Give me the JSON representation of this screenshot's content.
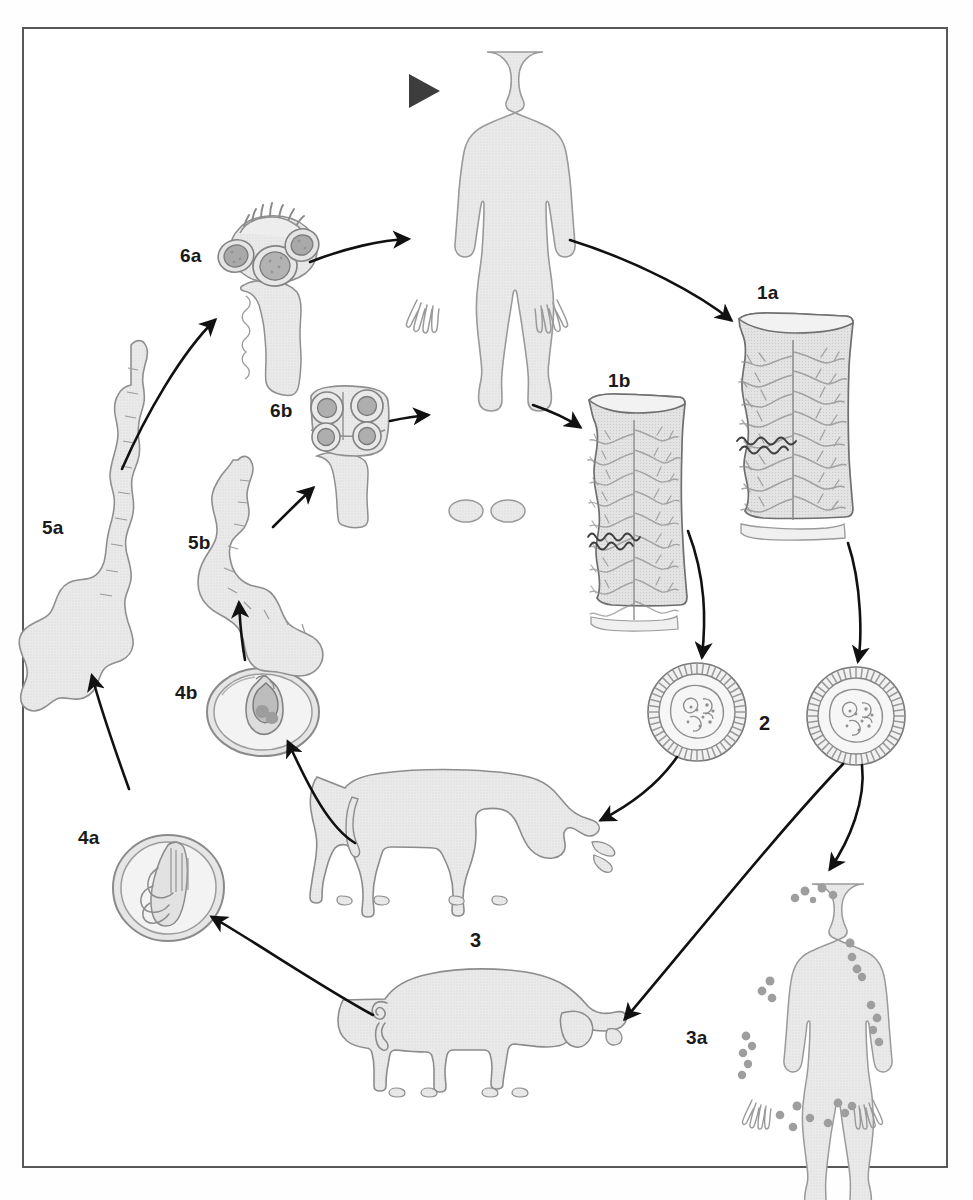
{
  "figure": {
    "kind": "parasite-life-cycle-diagram",
    "border_color": "#58585a",
    "background_color": "#ffffff",
    "body_fill": "#e8e8e8",
    "body_stroke": "#8c8c8c",
    "organ_fill": "#dedede",
    "organ_stroke": "#7d7d7d",
    "cyst_dot_color": "#9a9a9a",
    "arrow_color": "#111111",
    "label_color": "#1a1a1a",
    "marker_color": "#3a3a3a"
  },
  "labels": [
    {
      "id": "1a",
      "text": "1a",
      "x": 757,
      "y": 283,
      "desc": "gravid-proglottid-taenia-solium"
    },
    {
      "id": "1b",
      "text": "1b",
      "x": 608,
      "y": 371,
      "desc": "gravid-proglottid-taenia-saginata"
    },
    {
      "id": "2",
      "text": "2",
      "x": 759,
      "y": 713,
      "desc": "taeniid-egg"
    },
    {
      "id": "3",
      "text": "3",
      "x": 470,
      "y": 930,
      "desc": "intermediate-hosts-cattle-swine"
    },
    {
      "id": "3a",
      "text": "3a",
      "x": 686,
      "y": 1028,
      "desc": "human-cysticercosis"
    },
    {
      "id": "4a",
      "text": "4a",
      "x": 78,
      "y": 828,
      "desc": "cysticercus-cellulosae"
    },
    {
      "id": "4b",
      "text": "4b",
      "x": 175,
      "y": 683,
      "desc": "cysticercus-bovis"
    },
    {
      "id": "5a",
      "text": "5a",
      "x": 42,
      "y": 518,
      "desc": "evaginated-larva-developing-strobila-solium"
    },
    {
      "id": "5b",
      "text": "5b",
      "x": 188,
      "y": 533,
      "desc": "evaginated-larva-developing-strobila-saginata"
    },
    {
      "id": "6a",
      "text": "6a",
      "x": 180,
      "y": 246,
      "desc": "scolex-with-rostellum-and-hooks"
    },
    {
      "id": "6b",
      "text": "6b",
      "x": 270,
      "y": 401,
      "desc": "scolex-with-four-suckers"
    }
  ],
  "elements": {
    "definitive_host_human": "adult-human-silhouette-definitive-host",
    "infected_human": "human-silhouette-with-cysticerci",
    "cattle": "grazing-cow-silhouette",
    "swine": "pig-silhouette",
    "proglottid_a": "gravid-proglottid-branched-uterus",
    "proglottid_b": "gravid-proglottid-branched-uterus",
    "egg_left": "taeniid-egg-striated-embryophore",
    "egg_right": "taeniid-egg-striated-embryophore",
    "cysticercus_a": "cysticercus-larval-cyst",
    "cysticercus_b": "cysticercus-larval-cyst",
    "larva_a": "evaginated-larva-elongate",
    "larva_b": "evaginated-larva-curved",
    "scolex_a": "scolex-rostellum-hooks-suckers",
    "scolex_b": "scolex-four-suckers",
    "entry_marker": "solid-triangle-entry-marker"
  },
  "arrows": [
    {
      "id": "human-to-1a",
      "from": "definitive_host_human",
      "to": "proglottid_a"
    },
    {
      "id": "human-to-1b",
      "from": "definitive_host_human",
      "to": "proglottid_b"
    },
    {
      "id": "1a-to-egg-right",
      "from": "proglottid_a",
      "to": "egg_right"
    },
    {
      "id": "1b-to-egg-left",
      "from": "proglottid_b",
      "to": "egg_left"
    },
    {
      "id": "egg-left-to-cattle",
      "from": "egg_left",
      "to": "cattle"
    },
    {
      "id": "egg-right-to-swine",
      "from": "egg_right",
      "to": "swine"
    },
    {
      "id": "egg-right-to-human",
      "from": "egg_right",
      "to": "infected_human"
    },
    {
      "id": "swine-to-4a",
      "from": "swine",
      "to": "cysticercus_a"
    },
    {
      "id": "cattle-to-4b",
      "from": "cattle",
      "to": "cysticercus_b"
    },
    {
      "id": "4a-to-5a",
      "from": "cysticercus_a",
      "to": "larva_a"
    },
    {
      "id": "4b-to-5b",
      "from": "cysticercus_b",
      "to": "larva_b"
    },
    {
      "id": "5a-to-6a",
      "from": "larva_a",
      "to": "scolex_a"
    },
    {
      "id": "5b-to-6b",
      "from": "larva_b",
      "to": "scolex_b"
    },
    {
      "id": "6a-to-human",
      "from": "scolex_a",
      "to": "definitive_host_human"
    },
    {
      "id": "6b-to-human",
      "from": "scolex_b",
      "to": "definitive_host_human"
    }
  ]
}
